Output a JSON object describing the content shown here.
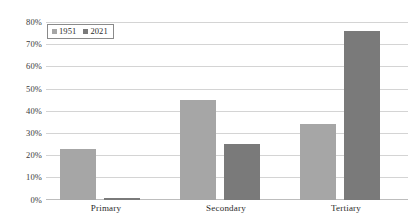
{
  "chart_data": {
    "type": "bar",
    "title": "",
    "subtitle": "",
    "xlabel": "",
    "ylabel": "",
    "categories": [
      "Primary",
      "Secondary",
      "Tertiary"
    ],
    "series": [
      {
        "name": "1951",
        "color": "#a6a6a6",
        "values": [
          23,
          45,
          34
        ]
      },
      {
        "name": "2021",
        "color": "#7a7a7a",
        "values": [
          1,
          25,
          76
        ]
      }
    ],
    "ylim": [
      0,
      80
    ],
    "ytick_values": [
      0,
      10,
      20,
      30,
      40,
      50,
      60,
      70,
      80
    ],
    "ytick_labels": [
      "0%",
      "10%",
      "20%",
      "30%",
      "40%",
      "50%",
      "60%",
      "70%",
      "80%"
    ],
    "value_suffix": "%",
    "grid": true,
    "grid_axis": "y",
    "grid_color": "#d4d4d4",
    "legend": {
      "position": "top-left",
      "entries": [
        {
          "label": "1951",
          "color": "#a6a6a6",
          "swatch_icon": "square-swatch-icon"
        },
        {
          "label": "2021",
          "color": "#7a7a7a",
          "swatch_icon": "square-swatch-icon"
        }
      ]
    },
    "background_color": "#ffffff"
  }
}
